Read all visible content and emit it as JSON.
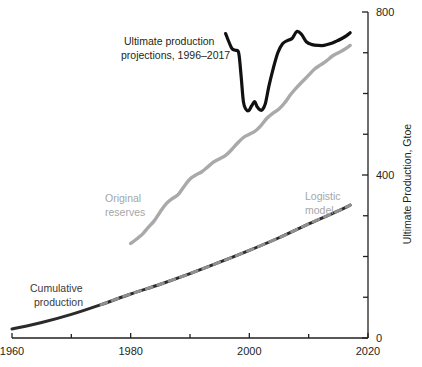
{
  "chart_data": {
    "type": "line",
    "title": "",
    "subtitle": "",
    "xlabel": "",
    "ylabel": "Ultimate Production, Gtoe",
    "xlim": [
      1960,
      2020
    ],
    "ylim": [
      0,
      800
    ],
    "grid": false,
    "legend_position": "inline-annotations",
    "x_ticks_major": [
      1960,
      1980,
      2000,
      2020
    ],
    "x_ticks_minor": [
      1970,
      1990,
      2010
    ],
    "x_tick_labels": [
      "1960",
      "1980",
      "2000",
      "2020"
    ],
    "y_ticks_major": [
      0,
      400,
      800
    ],
    "y_ticks_minor": [
      100,
      200,
      300,
      500,
      600,
      700
    ],
    "y_tick_labels": [
      "0",
      "400",
      "800"
    ],
    "annotations": [
      {
        "id": "projections-label",
        "text_line1": "Ultimate production",
        "text_line2": "projections, 1996–2017",
        "color": "#231f20"
      },
      {
        "id": "original-reserves-label",
        "text_line1": "Original",
        "text_line2": "reserves",
        "color": "#a6a6a6"
      },
      {
        "id": "logistic-model-label",
        "text_line1": "Logistic",
        "text_line2": "model",
        "color": "#a6a6a6"
      },
      {
        "id": "cumulative-production-label",
        "text_line1": "Cumulative",
        "text_line2": "production",
        "color": "#3a3a3a"
      }
    ],
    "series": [
      {
        "name": "Ultimate production projections, 1996-2017",
        "color": "#111111",
        "style": "solid",
        "width": 3.2,
        "x": [
          1996,
          1997,
          1997.6,
          1998.2,
          1998.6,
          1999,
          1999.4,
          1999.9,
          2000.4,
          2000.9,
          2001.3,
          2001.8,
          2002.2,
          2002.7,
          2003.3,
          2004,
          2004.8,
          2005.6,
          2006.4,
          2007.2,
          2008,
          2008.8,
          2009.6,
          2010.6,
          2011.6,
          2012.6,
          2013.6,
          2014.6,
          2015.6,
          2016.4,
          2017
        ],
        "y": [
          747,
          712,
          706,
          700,
          645,
          580,
          562,
          558,
          570,
          580,
          568,
          560,
          560,
          575,
          618,
          660,
          700,
          722,
          730,
          735,
          752,
          745,
          727,
          720,
          718,
          718,
          722,
          728,
          735,
          742,
          749
        ]
      },
      {
        "name": "Original reserves",
        "color": "#a9a9a9",
        "style": "solid",
        "width": 3.4,
        "x": [
          1980,
          1981,
          1982,
          1983,
          1984,
          1985,
          1986,
          1987,
          1988,
          1989,
          1990,
          1991,
          1992,
          1993,
          1994,
          1995,
          1996,
          1997,
          1998,
          1999,
          2000,
          2001,
          2002,
          2003,
          2004,
          2005,
          2006,
          2007,
          2008,
          2009,
          2010,
          2011,
          2012,
          2013,
          2014,
          2015,
          2016,
          2017
        ],
        "y": [
          232,
          243,
          255,
          272,
          288,
          310,
          330,
          342,
          352,
          372,
          390,
          400,
          408,
          420,
          432,
          440,
          448,
          462,
          478,
          492,
          500,
          508,
          522,
          540,
          552,
          562,
          578,
          598,
          615,
          630,
          645,
          660,
          670,
          680,
          692,
          700,
          708,
          718
        ]
      },
      {
        "name": "Cumulative production",
        "color": "#2b2b2b",
        "style": "solid",
        "width": 3.0,
        "x": [
          1960,
          1965,
          1970,
          1975,
          1980,
          1985,
          1990,
          1995,
          2000,
          2005,
          2010,
          2015,
          2017
        ],
        "y": [
          22,
          38,
          58,
          82,
          108,
          132,
          158,
          186,
          215,
          246,
          280,
          312,
          326
        ]
      },
      {
        "name": "Logistic model",
        "color": "#8f8f8f",
        "style": "dashed",
        "width": 3.0,
        "x": [
          1975,
          1980,
          1985,
          1990,
          1995,
          2000,
          2005,
          2010,
          2015,
          2017
        ],
        "y": [
          82,
          108,
          132,
          158,
          186,
          215,
          246,
          280,
          312,
          326
        ]
      }
    ]
  },
  "axes": {
    "y_axis_title": "Ultimate Production, Gtoe",
    "x_tick_labels": [
      "1960",
      "1980",
      "2000",
      "2020"
    ],
    "y_tick_labels": [
      "800",
      "400",
      "0"
    ]
  },
  "labels": {
    "projections_line1": "Ultimate production",
    "projections_line2": "projections, 1996–2017",
    "original_reserves_line1": "Original",
    "original_reserves_line2": "reserves",
    "logistic_line1": "Logistic",
    "logistic_line2": "model",
    "cumulative_line1": "Cumulative",
    "cumulative_line2": "production"
  }
}
